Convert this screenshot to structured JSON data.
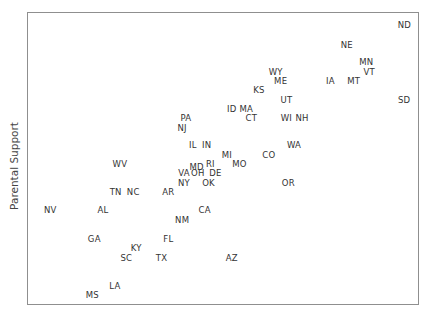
{
  "chart_data": {
    "type": "scatter",
    "title": "",
    "xlabel": "",
    "ylabel": "Parental Support",
    "grid": false,
    "legend": null,
    "marker": "text-label",
    "note": "Points are state abbreviations placed at (x, y) in normalized 0-1 plot coordinates (x left→right, y bottom→top); no axis ticks shown.",
    "points": [
      {
        "label": "ND",
        "x": 0.975,
        "y": 0.973
      },
      {
        "label": "NE",
        "x": 0.824,
        "y": 0.901
      },
      {
        "label": "MN",
        "x": 0.875,
        "y": 0.84
      },
      {
        "label": "VT",
        "x": 0.883,
        "y": 0.805
      },
      {
        "label": "WY",
        "x": 0.638,
        "y": 0.805
      },
      {
        "label": "ME",
        "x": 0.651,
        "y": 0.775
      },
      {
        "label": "IA",
        "x": 0.781,
        "y": 0.775
      },
      {
        "label": "MT",
        "x": 0.842,
        "y": 0.775
      },
      {
        "label": "KS",
        "x": 0.594,
        "y": 0.741
      },
      {
        "label": "UT",
        "x": 0.666,
        "y": 0.707
      },
      {
        "label": "SD",
        "x": 0.974,
        "y": 0.707
      },
      {
        "label": "ID",
        "x": 0.523,
        "y": 0.676
      },
      {
        "label": "MA",
        "x": 0.561,
        "y": 0.676
      },
      {
        "label": "CT",
        "x": 0.574,
        "y": 0.642
      },
      {
        "label": "WI",
        "x": 0.666,
        "y": 0.642
      },
      {
        "label": "NH",
        "x": 0.707,
        "y": 0.642
      },
      {
        "label": "PA",
        "x": 0.403,
        "y": 0.642
      },
      {
        "label": "NJ",
        "x": 0.393,
        "y": 0.608
      },
      {
        "label": "IL",
        "x": 0.421,
        "y": 0.546
      },
      {
        "label": "IN",
        "x": 0.457,
        "y": 0.546
      },
      {
        "label": "WA",
        "x": 0.686,
        "y": 0.546
      },
      {
        "label": "MI",
        "x": 0.51,
        "y": 0.512
      },
      {
        "label": "CO",
        "x": 0.62,
        "y": 0.512
      },
      {
        "label": "MO",
        "x": 0.543,
        "y": 0.481
      },
      {
        "label": "WV",
        "x": 0.23,
        "y": 0.481
      },
      {
        "label": "MD",
        "x": 0.431,
        "y": 0.471
      },
      {
        "label": "RI",
        "x": 0.467,
        "y": 0.481
      },
      {
        "label": "VA",
        "x": 0.398,
        "y": 0.447
      },
      {
        "label": "OH",
        "x": 0.434,
        "y": 0.447
      },
      {
        "label": "DE",
        "x": 0.48,
        "y": 0.447
      },
      {
        "label": "NY",
        "x": 0.398,
        "y": 0.413
      },
      {
        "label": "OK",
        "x": 0.462,
        "y": 0.413
      },
      {
        "label": "OR",
        "x": 0.671,
        "y": 0.413
      },
      {
        "label": "TN",
        "x": 0.219,
        "y": 0.382
      },
      {
        "label": "NC",
        "x": 0.265,
        "y": 0.382
      },
      {
        "label": "AR",
        "x": 0.357,
        "y": 0.382
      },
      {
        "label": "NV",
        "x": 0.048,
        "y": 0.317
      },
      {
        "label": "AL",
        "x": 0.186,
        "y": 0.317
      },
      {
        "label": "CA",
        "x": 0.452,
        "y": 0.317
      },
      {
        "label": "NM",
        "x": 0.393,
        "y": 0.283
      },
      {
        "label": "GA",
        "x": 0.163,
        "y": 0.215
      },
      {
        "label": "FL",
        "x": 0.357,
        "y": 0.215
      },
      {
        "label": "KY",
        "x": 0.273,
        "y": 0.184
      },
      {
        "label": "SC",
        "x": 0.247,
        "y": 0.15
      },
      {
        "label": "TX",
        "x": 0.339,
        "y": 0.15
      },
      {
        "label": "AZ",
        "x": 0.523,
        "y": 0.15
      },
      {
        "label": "LA",
        "x": 0.217,
        "y": 0.051
      },
      {
        "label": "MS",
        "x": 0.158,
        "y": 0.017
      }
    ]
  }
}
